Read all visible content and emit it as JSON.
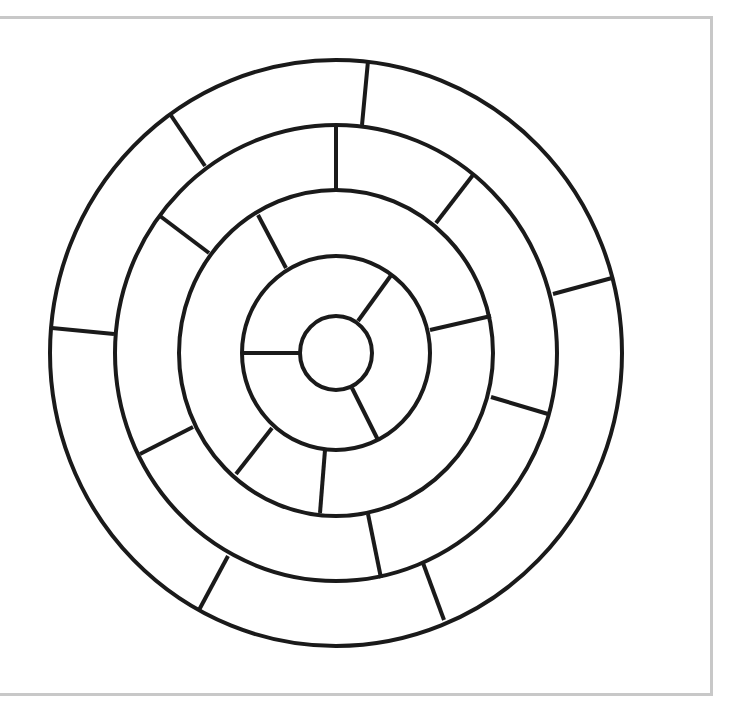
{
  "diagram": {
    "type": "circular-ring-maze",
    "frame_color": "#c8c8c8",
    "stroke_color": "#1a1a1a",
    "stroke_width": 4,
    "center": {
      "x": 336,
      "y": 353
    },
    "rings": [
      {
        "name": "outer",
        "rx": 286,
        "ry": 293
      },
      {
        "name": "ring-2",
        "rx": 221,
        "ry": 228
      },
      {
        "name": "ring-3",
        "rx": 157,
        "ry": 163
      },
      {
        "name": "ring-4",
        "rx": 94,
        "ry": 97
      },
      {
        "name": "center",
        "rx": 36,
        "ry": 37
      }
    ],
    "dividers": [
      {
        "between": "outer/ring-2",
        "x1": 368,
        "y1": 61,
        "x2": 362,
        "y2": 125
      },
      {
        "between": "outer/ring-2",
        "x1": 170,
        "y1": 114,
        "x2": 205,
        "y2": 166
      },
      {
        "between": "outer/ring-2",
        "x1": 52,
        "y1": 328,
        "x2": 114,
        "y2": 334
      },
      {
        "between": "outer/ring-2",
        "x1": 553,
        "y1": 294,
        "x2": 612,
        "y2": 278
      },
      {
        "between": "outer/ring-2",
        "x1": 228,
        "y1": 556,
        "x2": 199,
        "y2": 610
      },
      {
        "between": "outer/ring-2",
        "x1": 423,
        "y1": 563,
        "x2": 444,
        "y2": 620
      },
      {
        "between": "ring-2/ring-3",
        "x1": 336,
        "y1": 126,
        "x2": 336,
        "y2": 190
      },
      {
        "between": "ring-2/ring-3",
        "x1": 473,
        "y1": 175,
        "x2": 436,
        "y2": 223
      },
      {
        "between": "ring-2/ring-3",
        "x1": 160,
        "y1": 216,
        "x2": 209,
        "y2": 253
      },
      {
        "between": "ring-2/ring-3",
        "x1": 491,
        "y1": 397,
        "x2": 548,
        "y2": 414
      },
      {
        "between": "ring-2/ring-3",
        "x1": 140,
        "y1": 454,
        "x2": 193,
        "y2": 427
      },
      {
        "between": "ring-2/ring-3",
        "x1": 368,
        "y1": 514,
        "x2": 381,
        "y2": 578
      },
      {
        "between": "ring-3/ring-4",
        "x1": 286,
        "y1": 268,
        "x2": 258,
        "y2": 215
      },
      {
        "between": "ring-3/ring-4",
        "x1": 430,
        "y1": 330,
        "x2": 491,
        "y2": 316
      },
      {
        "between": "ring-3/ring-4",
        "x1": 272,
        "y1": 428,
        "x2": 236,
        "y2": 474
      },
      {
        "between": "ring-3/ring-4",
        "x1": 325,
        "y1": 450,
        "x2": 320,
        "y2": 513
      },
      {
        "between": "ring-4/center",
        "x1": 300,
        "y1": 353,
        "x2": 242,
        "y2": 353
      },
      {
        "between": "ring-4/center",
        "x1": 358,
        "y1": 321,
        "x2": 392,
        "y2": 274
      },
      {
        "between": "ring-4/center",
        "x1": 352,
        "y1": 388,
        "x2": 378,
        "y2": 440
      }
    ]
  }
}
